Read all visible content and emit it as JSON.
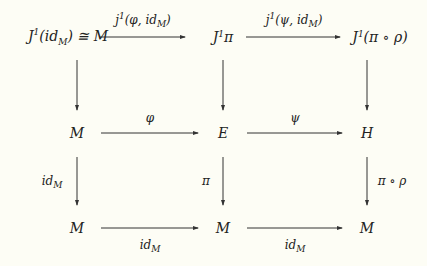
{
  "diagram": {
    "type": "commutative-diagram",
    "nodes": {
      "r1c1": "J¹(id_M) ≅ M",
      "r1c2": "J¹π",
      "r1c3": "J¹(π ∘ ρ)",
      "r2c1": "M",
      "r2c2": "E",
      "r2c3": "H",
      "r3c1": "M",
      "r3c2": "M",
      "r3c3": "M"
    },
    "arrows": [
      {
        "from": "r1c1",
        "to": "r1c2",
        "label": "j¹(φ, id_M)"
      },
      {
        "from": "r1c2",
        "to": "r1c3",
        "label": "j¹(ψ, id_M)"
      },
      {
        "from": "r1c1",
        "to": "r2c1",
        "label": ""
      },
      {
        "from": "r1c2",
        "to": "r2c2",
        "label": ""
      },
      {
        "from": "r1c3",
        "to": "r2c3",
        "label": ""
      },
      {
        "from": "r2c1",
        "to": "r2c2",
        "label": "φ"
      },
      {
        "from": "r2c2",
        "to": "r2c3",
        "label": "ψ"
      },
      {
        "from": "r2c1",
        "to": "r3c1",
        "label": "id_M"
      },
      {
        "from": "r2c2",
        "to": "r3c2",
        "label": "π"
      },
      {
        "from": "r2c3",
        "to": "r3c3",
        "label": "π ∘ ρ"
      },
      {
        "from": "r3c1",
        "to": "r3c2",
        "label": "id_M"
      },
      {
        "from": "r3c2",
        "to": "r3c3",
        "label": "id_M"
      }
    ],
    "display": {
      "r1c1_main": "J",
      "r1c1_sup": "1",
      "r1c1_open": "(id",
      "r1c1_sub": "M",
      "r1c1_close": ") ≅ M",
      "r1c2_main": "J",
      "r1c2_sup": "1",
      "r1c2_rest": "π",
      "r1c3_main": "J",
      "r1c3_sup": "1",
      "r1c3_rest": "(π ∘ ρ)",
      "a12_main": "j",
      "a12_sup": "1",
      "a12_rest": "(φ, id",
      "a12_sub": "M",
      "a12_close": ")",
      "a23_main": "j",
      "a23_sup": "1",
      "a23_rest": "(ψ, id",
      "a23_sub": "M",
      "a23_close": ")",
      "phi": "φ",
      "psi": "ψ",
      "pi": "π",
      "pirho": "π ∘ ρ",
      "id": "id",
      "sub_M": "M",
      "M": "M",
      "E": "E",
      "H": "H"
    }
  }
}
